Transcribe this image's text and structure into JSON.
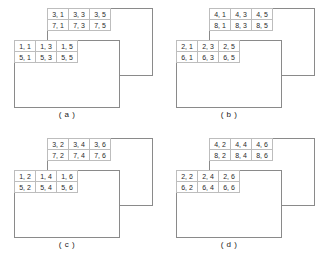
{
  "figure": {
    "panels": [
      {
        "id": "a",
        "label": "( a )",
        "back_plane": {
          "name": "back-plane",
          "rows": [
            [
              "3, 1",
              "3, 3",
              "3, 5"
            ],
            [
              "7, 1",
              "7, 3",
              "7, 5"
            ]
          ]
        },
        "front_plane": {
          "name": "front-plane",
          "rows": [
            [
              "1, 1",
              "1, 3",
              "1, 5"
            ],
            [
              "5, 1",
              "5, 3",
              "5, 5"
            ]
          ]
        }
      },
      {
        "id": "b",
        "label": "( b )",
        "back_plane": {
          "name": "back-plane",
          "rows": [
            [
              "4, 1",
              "4, 3",
              "4, 5"
            ],
            [
              "8, 1",
              "8, 3",
              "8, 5"
            ]
          ]
        },
        "front_plane": {
          "name": "front-plane",
          "rows": [
            [
              "2, 1",
              "2, 3",
              "2, 5"
            ],
            [
              "6, 1",
              "6, 3",
              "6, 5"
            ]
          ]
        }
      },
      {
        "id": "c",
        "label": "( c )",
        "back_plane": {
          "name": "back-plane",
          "rows": [
            [
              "3, 2",
              "3, 4",
              "3, 6"
            ],
            [
              "7, 2",
              "7, 4",
              "7, 6"
            ]
          ]
        },
        "front_plane": {
          "name": "front-plane",
          "rows": [
            [
              "1, 2",
              "1, 4",
              "1, 6"
            ],
            [
              "5, 2",
              "5, 4",
              "5, 6"
            ]
          ]
        }
      },
      {
        "id": "d",
        "label": "( d )",
        "back_plane": {
          "name": "back-plane",
          "rows": [
            [
              "4, 2",
              "4, 4",
              "4, 6"
            ],
            [
              "8, 2",
              "8, 4",
              "8, 6"
            ]
          ]
        },
        "front_plane": {
          "name": "front-plane",
          "rows": [
            [
              "2, 2",
              "2, 4",
              "2, 6"
            ],
            [
              "6, 2",
              "6, 4",
              "6, 6"
            ]
          ]
        }
      }
    ],
    "colors": {
      "rect_border": "#8a8a8a",
      "cell_border": "#bdbdbd",
      "text": "#2b2b2b",
      "background": "#ffffff"
    }
  }
}
